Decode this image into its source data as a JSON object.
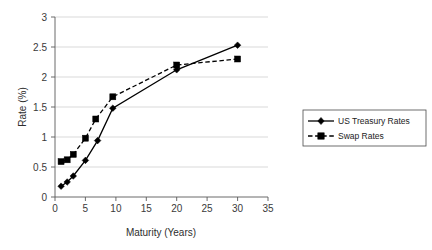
{
  "chart_data": {
    "type": "line",
    "title": "",
    "xlabel": "Maturity (Years)",
    "ylabel": "Rate (%)",
    "xlim": [
      0,
      35
    ],
    "ylim": [
      0,
      3
    ],
    "xticks": [
      "0",
      "5",
      "10",
      "15",
      "20",
      "25",
      "30",
      "35"
    ],
    "yticks": [
      "0",
      "0.5",
      "1",
      "1.5",
      "2",
      "2.5",
      "3"
    ],
    "grid": "horizontal",
    "legend_position": "right-outside",
    "series": [
      {
        "name": "US Treasury Rates",
        "marker": "diamond",
        "linestyle": "solid",
        "color": "#000000",
        "x": [
          1,
          2,
          3,
          5,
          7,
          9.5,
          20,
          30
        ],
        "values": [
          0.18,
          0.25,
          0.35,
          0.61,
          0.94,
          1.48,
          2.12,
          2.53
        ]
      },
      {
        "name": "Swap Rates",
        "marker": "square",
        "linestyle": "dashed",
        "color": "#000000",
        "x": [
          1,
          2,
          3,
          5,
          6.7,
          9.5,
          20,
          30
        ],
        "values": [
          0.59,
          0.62,
          0.71,
          0.98,
          1.3,
          1.67,
          2.2,
          2.3
        ]
      }
    ]
  },
  "legend": {
    "entries": [
      {
        "label": "US Treasury Rates"
      },
      {
        "label": "Swap Rates"
      }
    ]
  },
  "axes": {
    "x_title": "Maturity (Years)",
    "y_title": "Rate (%)"
  }
}
